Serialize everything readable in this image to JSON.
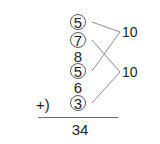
{
  "problem": {
    "operator_label": "+)",
    "addends": [
      {
        "value": "5",
        "circled": true,
        "top": 13
      },
      {
        "value": "7",
        "circled": true,
        "top": 31
      },
      {
        "value": "8",
        "circled": false,
        "top": 47
      },
      {
        "value": "5",
        "circled": true,
        "top": 62
      },
      {
        "value": "6",
        "circled": false,
        "top": 78
      },
      {
        "value": "3",
        "circled": true,
        "top": 94
      }
    ],
    "sum": "34",
    "groups": [
      {
        "label": "10",
        "members": [
          "5",
          "5"
        ]
      },
      {
        "label": "10",
        "members": [
          "7",
          "3"
        ]
      }
    ]
  },
  "connectors": {
    "color": "#8c8c94",
    "paths": [
      {
        "name": "five-top-to-ten-top",
        "x1": 92,
        "y1": 22,
        "x2": 120,
        "y2": 32
      },
      {
        "name": "five-fourth-to-ten-top",
        "x1": 92,
        "y1": 71,
        "x2": 120,
        "y2": 32
      },
      {
        "name": "seven-to-ten-bottom",
        "x1": 92,
        "y1": 40,
        "x2": 120,
        "y2": 72
      },
      {
        "name": "three-to-ten-bottom",
        "x1": 92,
        "y1": 103,
        "x2": 120,
        "y2": 72
      }
    ]
  },
  "colors": {
    "ink": "#231f20",
    "circle_stroke": "#5b5b63",
    "rule": "#6a6a72",
    "connector": "#8c8c94",
    "background": "#ffffff"
  }
}
